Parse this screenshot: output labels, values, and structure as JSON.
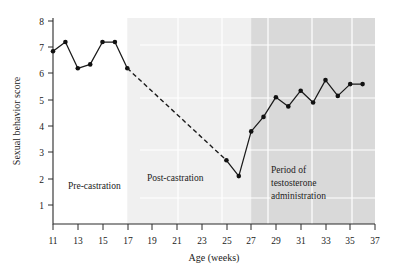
{
  "chart_data": {
    "type": "line",
    "title": "",
    "xlabel": "Age (weeks)",
    "ylabel": "Sexual behavior score",
    "xlim": [
      11,
      37
    ],
    "ylim": [
      0.4,
      8
    ],
    "xticks": [
      11,
      13,
      15,
      17,
      19,
      21,
      23,
      25,
      27,
      29,
      31,
      33,
      35,
      37
    ],
    "xticklabels": [
      "11",
      "13",
      "15",
      "17",
      "19",
      "21",
      "23",
      "25",
      "27",
      "29",
      "31",
      "33",
      "35",
      "37"
    ],
    "yticks": [
      1,
      2,
      3,
      4,
      5,
      6,
      7,
      8
    ],
    "yticklabels": [
      "1",
      "2",
      "3",
      "4",
      "5",
      "6",
      "7",
      "8"
    ],
    "grid": false,
    "legend": "none",
    "series": [
      {
        "name": "Pre-castration observed",
        "style": "solid",
        "x": [
          11,
          12,
          13,
          14,
          15,
          16,
          17
        ],
        "values": [
          6.85,
          7.2,
          6.2,
          6.35,
          7.2,
          7.2,
          6.2
        ]
      },
      {
        "name": "Post-castration decline (interpolated)",
        "style": "dashed",
        "x": [
          17,
          25
        ],
        "values": [
          6.2,
          2.7
        ]
      },
      {
        "name": "Post-castration and testosterone administration observed",
        "style": "solid",
        "x": [
          25,
          26,
          27,
          28,
          29,
          30,
          31,
          32,
          33,
          34,
          35,
          36
        ],
        "values": [
          2.7,
          2.1,
          3.8,
          4.35,
          5.1,
          4.75,
          5.35,
          4.9,
          5.75,
          5.15,
          5.6,
          5.6
        ]
      }
    ],
    "regions": [
      {
        "name": "pre-castration",
        "label": "Pre-castration",
        "x_start": 11,
        "x_end": 17,
        "shade": "none",
        "color": "#ffffff"
      },
      {
        "name": "post-castration",
        "label": "Post-castration",
        "x_start": 17,
        "x_end": 27,
        "shade": "light",
        "color": "#f0f0f0"
      },
      {
        "name": "testosterone-administration",
        "label": "Period of testosterone administration",
        "label_lines": [
          "Period of",
          "testosterone",
          "administration"
        ],
        "x_start": 27,
        "x_end": 37,
        "shade": "dark",
        "color": "#d9d9d9"
      }
    ],
    "marker_color": "#111111",
    "line_color": "#1a1a1a"
  }
}
